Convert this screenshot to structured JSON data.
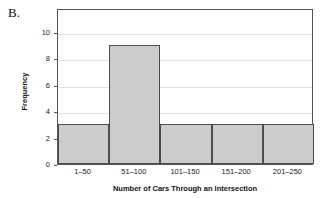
{
  "panel": {
    "label": "B."
  },
  "chart_data": {
    "type": "bar",
    "title": "",
    "subtitle": "",
    "categories": [
      "1–50",
      "51–100",
      "101–150",
      "151–200",
      "201–250"
    ],
    "values": [
      3,
      9,
      3,
      3,
      3
    ],
    "series": [
      {
        "name": "Frequency",
        "values": [
          3,
          9,
          3,
          3,
          3
        ]
      }
    ],
    "xlabel": "Number of Cars Through an Intersection",
    "ylabel": "Frequency",
    "ylim": [
      0,
      11.8
    ],
    "yticks": [
      0,
      2,
      4,
      6,
      8,
      10
    ],
    "ytick_labels": [
      "0",
      "2",
      "4",
      "6",
      "8",
      "10"
    ],
    "grid": "horizontal",
    "legend": "none",
    "bar_fill_color": "#cccccc",
    "bar_edge_color": "#4d4d4d",
    "gridline_color": "#e2e2e2",
    "axis_color": "#555555",
    "background_color": "#ffffff",
    "bar_gap": 0,
    "annotations": []
  }
}
